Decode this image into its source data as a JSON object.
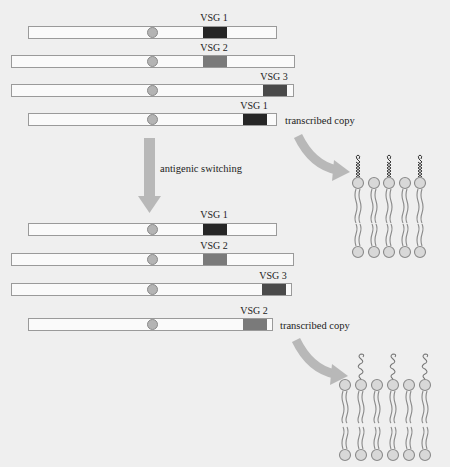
{
  "colors": {
    "background": "#efefef",
    "bar_fill": "#fafafa",
    "bar_border": "#9a9a9a",
    "vsg1": "#262626",
    "vsg2": "#7a7a7a",
    "vsg3": "#4a4a4a",
    "arrow": "#b8b8b8",
    "lipid_head": "#d6d6d6"
  },
  "before_switch": {
    "bars": [
      {
        "label": "VSG 1",
        "variant": "vsg1",
        "x": 28,
        "y": 26,
        "w": 249,
        "block_x": 202,
        "block_w": 24,
        "expressed": false
      },
      {
        "label": "VSG 2",
        "variant": "vsg2",
        "x": 11,
        "y": 55,
        "w": 284,
        "block_x": 202,
        "block_w": 24,
        "expressed": false
      },
      {
        "label": "VSG 3",
        "variant": "vsg3",
        "x": 11,
        "y": 84,
        "w": 283,
        "block_x": 262,
        "block_w": 24,
        "expressed": false
      },
      {
        "label": "VSG 1",
        "variant": "vsg1",
        "x": 28,
        "y": 113,
        "w": 249,
        "block_x": 242,
        "block_w": 24,
        "expressed": true
      }
    ],
    "transcribed_label": "transcribed copy"
  },
  "switch_label": "antigenic switching",
  "after_switch": {
    "bars": [
      {
        "label": "VSG 1",
        "variant": "vsg1",
        "x": 28,
        "y": 223,
        "w": 249,
        "block_x": 202,
        "block_w": 24,
        "expressed": false
      },
      {
        "label": "VSG 2",
        "variant": "vsg2",
        "x": 11,
        "y": 253,
        "w": 283,
        "block_x": 202,
        "block_w": 24,
        "expressed": false
      },
      {
        "label": "VSG 3",
        "variant": "vsg3",
        "x": 11,
        "y": 283,
        "w": 281,
        "block_x": 261,
        "block_w": 24,
        "expressed": false
      },
      {
        "label": "VSG 2",
        "variant": "vsg2",
        "x": 28,
        "y": 318,
        "w": 245,
        "block_x": 242,
        "block_w": 24,
        "expressed": true
      }
    ],
    "transcribed_label": "transcribed copy"
  },
  "membranes": [
    {
      "name": "membrane-vsg1",
      "heads_x": [
        358,
        374,
        389,
        405,
        420
      ],
      "protein_x": [
        358,
        389,
        420
      ],
      "top_y": 183,
      "bottom_y": 252,
      "protein_style": "helix"
    },
    {
      "name": "membrane-vsg2",
      "heads_x": [
        345,
        361,
        377,
        393,
        409,
        425
      ],
      "protein_x": [
        361,
        393,
        425
      ],
      "top_y": 385,
      "bottom_y": 455,
      "protein_style": "coil"
    }
  ]
}
